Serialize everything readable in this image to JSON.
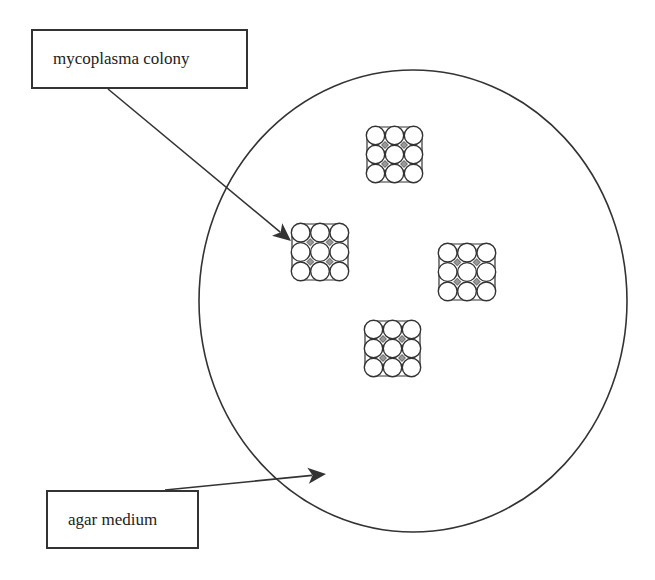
{
  "diagram": {
    "labels": {
      "colony": "mycoplasma colony",
      "agar": "agar medium"
    },
    "colors": {
      "stroke": "#333333",
      "text": "#222222",
      "background": "#ffffff",
      "junction_fill": "#9a9a9a"
    },
    "plate": {
      "shape": "ellipse",
      "cx": 413,
      "cy": 301,
      "rx": 214,
      "ry": 231
    },
    "colonies": [
      {
        "name": "colony-top",
        "x": 366,
        "y": 126,
        "size": 57,
        "rows": 3,
        "cols": 3
      },
      {
        "name": "colony-left",
        "x": 291,
        "y": 223,
        "size": 58,
        "rows": 3,
        "cols": 3
      },
      {
        "name": "colony-right",
        "x": 438,
        "y": 243,
        "size": 58,
        "rows": 3,
        "cols": 3
      },
      {
        "name": "colony-bottom",
        "x": 364,
        "y": 320,
        "size": 57,
        "rows": 3,
        "cols": 3
      }
    ],
    "arrows": [
      {
        "name": "colony-pointer-arrow",
        "from": [
          108,
          89
        ],
        "to": [
          291,
          241
        ]
      },
      {
        "name": "agar-pointer-arrow",
        "from": [
          165,
          490
        ],
        "to": [
          326,
          474
        ]
      }
    ]
  }
}
